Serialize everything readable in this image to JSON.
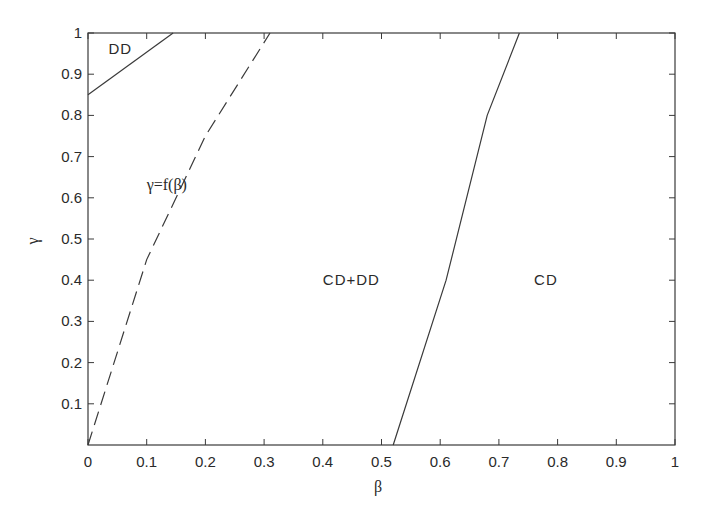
{
  "chart_data": {
    "type": "line",
    "title": "",
    "xlabel": "β",
    "ylabel": "γ",
    "xlim": [
      0,
      1
    ],
    "ylim": [
      0,
      1
    ],
    "grid": false,
    "xticks": [
      "0",
      "0.1",
      "0.2",
      "0.3",
      "0.4",
      "0.5",
      "0.6",
      "0.7",
      "0.8",
      "0.9",
      "1"
    ],
    "yticks": [
      "0.1",
      "0.2",
      "0.3",
      "0.4",
      "0.5",
      "0.6",
      "0.7",
      "0.8",
      "0.9",
      "1"
    ],
    "series": [
      {
        "name": "DD boundary",
        "style": "solid",
        "x": [
          0,
          0.145
        ],
        "y": [
          0.85,
          1.0
        ]
      },
      {
        "name": "γ=f(β)",
        "style": "dashed",
        "x": [
          0,
          0.1,
          0.2,
          0.31
        ],
        "y": [
          0,
          0.45,
          0.75,
          1.0
        ]
      },
      {
        "name": "CD boundary",
        "style": "solid",
        "x": [
          0.52,
          0.61,
          0.68,
          0.735
        ],
        "y": [
          0,
          0.4,
          0.8,
          1.0
        ]
      }
    ],
    "annotations": [
      {
        "text": "DD",
        "x": 0.035,
        "y": 0.96
      },
      {
        "text": "γ=f(β)",
        "x": 0.1,
        "y": 0.63
      },
      {
        "text": "CD+DD",
        "x": 0.4,
        "y": 0.4
      },
      {
        "text": "CD",
        "x": 0.76,
        "y": 0.4
      }
    ]
  }
}
